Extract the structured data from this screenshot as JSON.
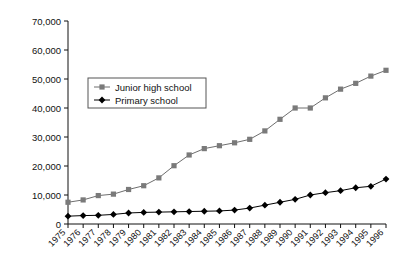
{
  "chart_data": {
    "type": "line",
    "title": "",
    "xlabel": "",
    "ylabel": "",
    "grid": false,
    "legend_position": "upper-left-inside",
    "ylim": [
      0,
      70000
    ],
    "yticks": [
      0,
      10000,
      20000,
      30000,
      40000,
      50000,
      60000,
      70000
    ],
    "ytick_labels": [
      "0",
      "10,000",
      "20,000",
      "30,000",
      "40,000",
      "50,000",
      "60,000",
      "70,000"
    ],
    "categories": [
      "1975",
      "1976",
      "1977",
      "1978",
      "1979",
      "1980",
      "1981",
      "1982",
      "1983",
      "1984",
      "1985",
      "1986",
      "1987",
      "1988",
      "1989",
      "1990",
      "1991",
      "1992",
      "1993",
      "1994",
      "1995",
      "1996"
    ],
    "series": [
      {
        "name": "Junior high school",
        "marker": "square",
        "color": "#7a7a7a",
        "line_color": "#6e6e6e",
        "values": [
          7500,
          8300,
          9800,
          10300,
          11900,
          13200,
          15900,
          20100,
          23800,
          26000,
          27000,
          28000,
          29200,
          32100,
          36100,
          40000,
          40000,
          43500,
          46500,
          48500,
          51000,
          53000
        ]
      },
      {
        "name": "Primary school",
        "marker": "diamond",
        "color": "#000000",
        "line_color": "#000000",
        "values": [
          2700,
          2900,
          3000,
          3300,
          3800,
          4000,
          4100,
          4200,
          4300,
          4400,
          4500,
          4800,
          5500,
          6500,
          7500,
          8500,
          10000,
          10800,
          11500,
          12500,
          13000,
          15500
        ]
      }
    ]
  },
  "legend": {
    "items": [
      {
        "label": "Junior high school"
      },
      {
        "label": "Primary school"
      }
    ]
  }
}
